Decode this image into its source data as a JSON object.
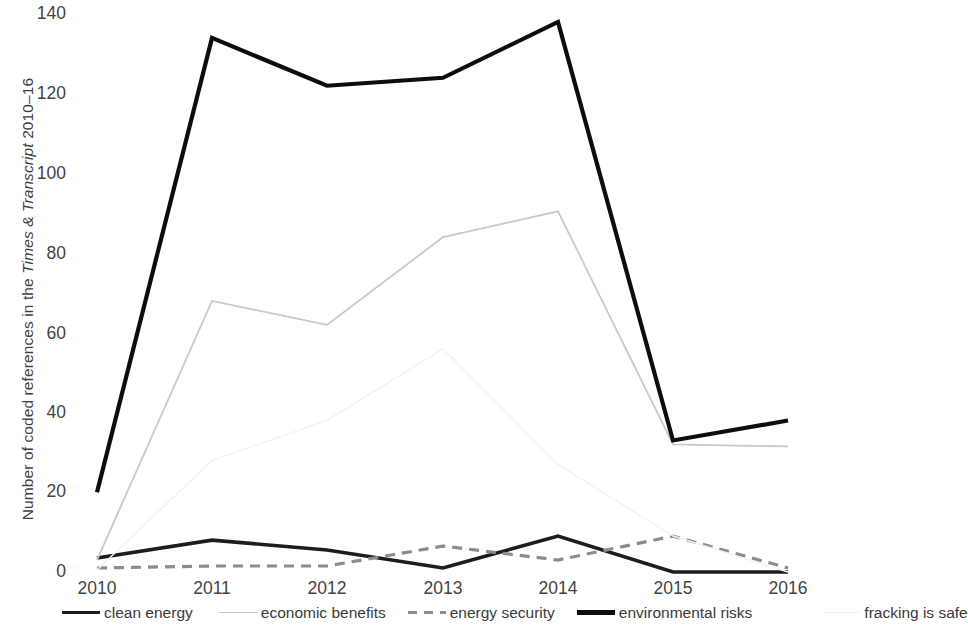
{
  "axis": {
    "ylabel_prefix": "Number of coded references in the ",
    "ylabel_italic": "Times & Transcript",
    "ylabel_suffix": " 2010–16",
    "yticks": [
      "140",
      "120",
      "100",
      "80",
      "60",
      "40",
      "20",
      "0"
    ],
    "xticks": [
      "2010",
      "2011",
      "2012",
      "2013",
      "2014",
      "2015",
      "2016"
    ]
  },
  "legend": {
    "items": [
      {
        "label": "clean energy",
        "color": "#1d1d1d",
        "width": 3.6,
        "dash": "none",
        "swatch": "legend-line-clean-energy"
      },
      {
        "label": "economic benefits",
        "color": "#c9c9c9",
        "width": 1.6,
        "dash": "none",
        "swatch": "legend-line-economic-benefits"
      },
      {
        "label": "energy security",
        "color": "#8c8c8c",
        "width": 3.2,
        "dash": "dashed",
        "swatch": "legend-line-energy-security"
      },
      {
        "label": "environmental risks",
        "color": "#0d0d0d",
        "width": 4.2,
        "dash": "none",
        "swatch": "legend-line-environmental-risks"
      },
      {
        "label": "fracking is safe",
        "color": "#f2f2f2",
        "width": 1.4,
        "dash": "none",
        "swatch": "legend-line-fracking-is-safe"
      }
    ]
  },
  "chart_data": {
    "type": "line",
    "title": "",
    "xlabel": "",
    "ylabel": "Number of coded references in the Times & Transcript 2010–16",
    "categories": [
      "2010",
      "2011",
      "2012",
      "2013",
      "2014",
      "2015",
      "2016"
    ],
    "ylim": [
      0,
      140
    ],
    "ytick_step": 20,
    "grid": false,
    "legend_position": "bottom",
    "series": [
      {
        "name": "clean energy",
        "values": [
          3.5,
          8,
          5.5,
          1,
          9,
          0,
          0
        ],
        "color": "#1d1d1d",
        "width": 3.6,
        "dash": "none"
      },
      {
        "name": "economic benefits",
        "values": [
          3,
          68,
          62,
          84,
          90.5,
          32,
          31.5
        ],
        "color": "#c9c9c9",
        "width": 1.8,
        "dash": "none"
      },
      {
        "name": "energy security",
        "values": [
          1,
          1.5,
          1.5,
          6.5,
          3,
          9,
          1
        ],
        "color": "#8c8c8c",
        "width": 3.2,
        "dash": "10 7"
      },
      {
        "name": "environmental risks",
        "values": [
          20,
          134,
          122,
          124,
          138,
          33,
          38
        ],
        "color": "#0d0d0d",
        "width": 4.2,
        "dash": "none"
      },
      {
        "name": "fracking is safe",
        "values": [
          0.5,
          28,
          38,
          56,
          27,
          9,
          0
        ],
        "color": "#f3f3f3",
        "width": 1.6,
        "dash": "none"
      }
    ]
  },
  "geometry": {
    "x_positions": [
      97,
      212,
      327,
      443,
      558,
      673,
      788
    ],
    "y_zero": 572,
    "y_max": 14,
    "y_tick_positions": [
      14,
      94,
      174,
      254,
      334,
      413,
      492,
      572
    ]
  }
}
